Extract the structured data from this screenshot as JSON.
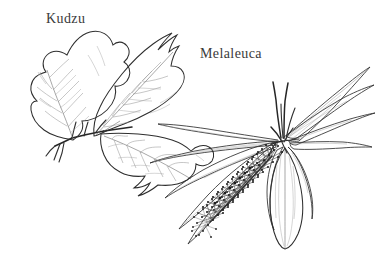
{
  "image": {
    "kind": "botanical-line-drawing",
    "background_color": "#ffffff",
    "ink_color": "#2e2e2e",
    "width": 376,
    "height": 270
  },
  "labels": {
    "kudzu": "Kudzu",
    "melaleuca": "Melaleuca"
  },
  "specimens": [
    {
      "name": "Kudzu",
      "description": "trifoliate broad lobed leaves on a vine stem",
      "leaflets": 3
    },
    {
      "name": "Melaleuca",
      "description": "narrow lanceolate leaves with a cylindrical bottlebrush flower spike",
      "flower_spikes": 1
    }
  ]
}
